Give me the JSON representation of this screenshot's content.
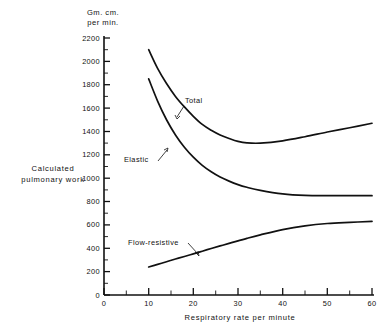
{
  "chart_data": {
    "type": "line",
    "title": "",
    "xlabel": "Respiratory rate per minute",
    "ylabel": "Calculated pulmonary work",
    "yunit": "Gm. cm. per min.",
    "yunit_line1": "Gm. cm.",
    "yunit_line2": "per min.",
    "ylabel_line1": "Calculated",
    "ylabel_line2": "pulmonary work",
    "xlim": [
      0,
      60
    ],
    "ylim": [
      0,
      2200
    ],
    "x_ticks": [
      0,
      10,
      20,
      30,
      40,
      50,
      60
    ],
    "x_tick_labels": [
      "0",
      "10",
      "20",
      "30",
      "40",
      "50",
      "60"
    ],
    "x_minor_ticks": [
      5,
      15,
      25,
      35,
      45,
      55
    ],
    "y_ticks": [
      0,
      200,
      400,
      600,
      800,
      1000,
      1200,
      1400,
      1600,
      1800,
      2000,
      2200
    ],
    "y_tick_labels": [
      "0",
      "200",
      "400",
      "600",
      "800",
      "1000",
      "1200",
      "1400",
      "1600",
      "1800",
      "2000",
      "2200"
    ],
    "grid": false,
    "legend": "inline-annotations",
    "line_color": "#111111",
    "x": [
      10,
      12,
      14,
      16,
      18,
      20,
      22,
      24,
      26,
      28,
      30,
      32,
      35,
      40,
      45,
      50,
      55,
      60
    ],
    "series": [
      {
        "name": "Total",
        "label": "Total",
        "values": [
          2100,
          1940,
          1810,
          1700,
          1610,
          1530,
          1460,
          1410,
          1370,
          1340,
          1315,
          1302,
          1300,
          1320,
          1355,
          1395,
          1432,
          1470
        ]
      },
      {
        "name": "Elastic",
        "label": "Elastic",
        "values": [
          1850,
          1660,
          1500,
          1370,
          1265,
          1180,
          1110,
          1055,
          1010,
          975,
          945,
          922,
          895,
          865,
          852,
          850,
          850,
          850
        ]
      },
      {
        "name": "Flow-resistive",
        "label": "Flow-resistive",
        "values": [
          240,
          262,
          285,
          308,
          330,
          352,
          375,
          398,
          420,
          442,
          463,
          485,
          515,
          560,
          592,
          612,
          622,
          630
        ]
      }
    ],
    "annotations": [
      {
        "series": "Total",
        "text": "Total",
        "x": 22,
        "y": 1600
      },
      {
        "series": "Elastic",
        "text": "Elastic",
        "x": 13,
        "y": 1080
      },
      {
        "series": "Flow-resistive",
        "text": "Flow-resistive",
        "x": 14,
        "y": 520
      }
    ]
  }
}
